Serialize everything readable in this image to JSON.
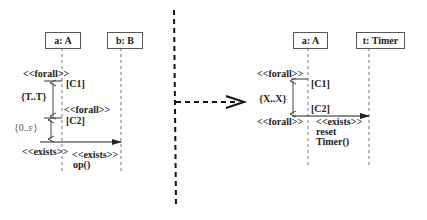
{
  "left": {
    "lifelines": [
      {
        "label": "a: A"
      },
      {
        "label": "b: B"
      }
    ],
    "forall_top": "<<forall>>",
    "c1": "[C1]",
    "interval_1": "{T..T}",
    "forall_mid": "<<forall>>",
    "c2": "[C2]",
    "interval_2": "{0..ε}",
    "exists_left": "<<exists>>",
    "exists_msg": "<<exists>>",
    "message": "op()"
  },
  "transform_arrow": "dashed-open-arrow",
  "right": {
    "lifelines": [
      {
        "label": "a: A"
      },
      {
        "label": "t: Timer"
      }
    ],
    "forall_top": "<<forall>>",
    "c1": "[C1]",
    "interval": "{X..X}",
    "c2": "[C2]",
    "forall_bottom": "<<forall>>",
    "exists_msg": "<<exists>>",
    "message_line1": "reset",
    "message_line2": "Timer()"
  },
  "colors": {
    "line": "#333333",
    "lifeline": "#777777",
    "divider": "#111111"
  }
}
